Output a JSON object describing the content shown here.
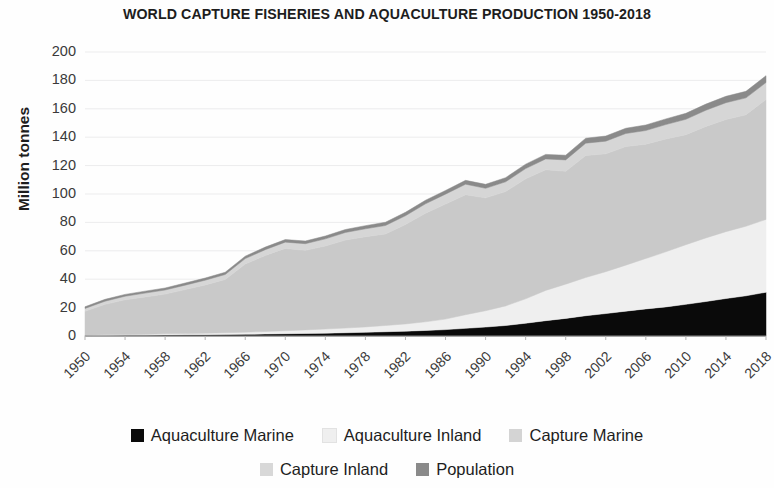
{
  "chart_data": {
    "type": "area",
    "stacked": true,
    "title": "WORLD CAPTURE FISHERIES AND AQUACULTURE PRODUCTION 1950-2018",
    "xlabel": "",
    "ylabel": "Million tonnes",
    "ylim": [
      0,
      200
    ],
    "ytick_step": 20,
    "ytick_labels": [
      "200",
      "180",
      "160",
      "140",
      "120",
      "100",
      "80",
      "60",
      "40",
      "20",
      "0"
    ],
    "xlim": [
      1950,
      2018
    ],
    "xtick_step": 4,
    "xtick_labels": [
      "1950",
      "1954",
      "1958",
      "1962",
      "1966",
      "1970",
      "1974",
      "1978",
      "1982",
      "1986",
      "1990",
      "1994",
      "1998",
      "2002",
      "2006",
      "2010",
      "2014",
      "2018"
    ],
    "xtick_rotation": -45,
    "grid": "horizontal-faint",
    "legend_position": "bottom",
    "x": [
      1950,
      1952,
      1954,
      1956,
      1958,
      1960,
      1962,
      1964,
      1966,
      1968,
      1970,
      1972,
      1974,
      1976,
      1978,
      1980,
      1982,
      1984,
      1986,
      1988,
      1990,
      1992,
      1994,
      1996,
      1998,
      2000,
      2002,
      2004,
      2006,
      2008,
      2010,
      2012,
      2014,
      2016,
      2018
    ],
    "series": [
      {
        "name": "Aquaculture Marine",
        "color": "#0a0a0a",
        "values": [
          0.3,
          0.4,
          0.5,
          0.6,
          0.7,
          0.8,
          0.9,
          1.0,
          1.2,
          1.4,
          1.6,
          1.8,
          2.0,
          2.3,
          2.6,
          3.0,
          3.4,
          3.9,
          4.5,
          5.4,
          6.3,
          7.4,
          9.0,
          10.8,
          12.4,
          14.3,
          15.8,
          17.5,
          19.1,
          20.5,
          22.3,
          24.3,
          26.4,
          28.3,
          30.8
        ]
      },
      {
        "name": "Aquaculture Inland",
        "color": "#efefef",
        "values": [
          0.3,
          0.4,
          0.5,
          0.6,
          0.8,
          0.9,
          1.1,
          1.3,
          1.5,
          1.8,
          2.1,
          2.5,
          2.9,
          3.3,
          3.8,
          4.4,
          5.1,
          6.1,
          7.4,
          9.6,
          11.5,
          13.8,
          17.2,
          21.3,
          24.1,
          26.9,
          29.5,
          32.4,
          35.5,
          38.8,
          42.0,
          44.8,
          47.1,
          49.0,
          51.3
        ]
      },
      {
        "name": "Capture Marine",
        "color": "#c9c9c9",
        "values": [
          16.8,
          21.5,
          24.5,
          26.3,
          28.0,
          31.0,
          34.0,
          37.5,
          48.0,
          53.5,
          58.0,
          56.0,
          58.5,
          62.0,
          63.5,
          64.5,
          70.0,
          76.5,
          81.0,
          84.5,
          79.5,
          80.5,
          84.5,
          85.0,
          79.5,
          86.0,
          83.0,
          83.5,
          80.5,
          79.5,
          77.5,
          78.5,
          79.0,
          78.5,
          84.4
        ]
      },
      {
        "name": "Capture Inland",
        "color": "#d6d6d6",
        "values": [
          2.0,
          2.2,
          2.5,
          2.7,
          2.9,
          3.1,
          3.3,
          3.5,
          3.8,
          4.1,
          4.4,
          4.7,
          5.0,
          5.3,
          5.6,
          5.9,
          6.2,
          6.6,
          7.0,
          7.4,
          6.7,
          6.9,
          7.2,
          7.6,
          8.0,
          8.6,
          8.9,
          9.2,
          9.6,
          10.1,
          10.8,
          11.4,
          11.8,
          11.9,
          12.0
        ]
      },
      {
        "name": "Population",
        "color": "#8a8a8a",
        "values": [
          1.2,
          1.3,
          1.3,
          1.4,
          1.4,
          1.5,
          1.5,
          1.6,
          1.7,
          1.8,
          1.8,
          1.9,
          2.0,
          2.1,
          2.2,
          2.3,
          2.4,
          2.5,
          2.6,
          2.7,
          2.8,
          2.9,
          3.1,
          3.2,
          3.3,
          3.5,
          3.6,
          3.7,
          3.9,
          4.0,
          4.2,
          4.3,
          4.5,
          4.6,
          4.8
        ]
      }
    ],
    "totals_note": "Stacked totals rise from about 20 million tonnes in 1950 to about 183 million tonnes in 2018."
  },
  "legend": {
    "row1": [
      {
        "label": "Aquaculture Marine",
        "color": "#0a0a0a"
      },
      {
        "label": "Aquaculture Inland",
        "color": "#efefef"
      },
      {
        "label": "Capture Marine",
        "color": "#d4d4d4"
      }
    ],
    "row2": [
      {
        "label": "Capture Inland",
        "color": "#d8d8d8"
      },
      {
        "label": "Population",
        "color": "#8a8a8a"
      }
    ]
  }
}
